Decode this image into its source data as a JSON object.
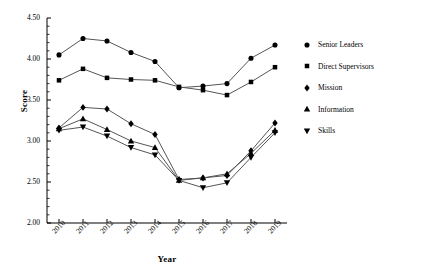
{
  "chart_data": {
    "type": "line",
    "title": "",
    "xlabel": "Year",
    "ylabel": "Score",
    "categories": [
      "2010",
      "2011",
      "2012",
      "2013",
      "2014",
      "2015",
      "2016",
      "2017",
      "2018",
      "2019"
    ],
    "ylim": [
      2.0,
      4.5
    ],
    "ytick_labels": [
      "2.00",
      "2.50",
      "3.00",
      "3.50",
      "4.00",
      "4.50"
    ],
    "ytick_values": [
      2.0,
      2.5,
      3.0,
      3.5,
      4.0,
      4.5
    ],
    "ytick_step": 0.5,
    "minor_ticks_per_interval": 5,
    "grid": false,
    "legend_position": "right",
    "series": [
      {
        "name": "Senior Leaders",
        "marker": "circle",
        "values": [
          4.05,
          4.25,
          4.22,
          4.08,
          3.97,
          3.65,
          3.67,
          3.7,
          4.01,
          4.17
        ]
      },
      {
        "name": "Direct Supervisors",
        "marker": "square",
        "values": [
          3.74,
          3.88,
          3.77,
          3.75,
          3.74,
          3.66,
          3.62,
          3.56,
          3.72,
          3.9
        ]
      },
      {
        "name": "Mission",
        "marker": "diamond",
        "values": [
          3.16,
          3.41,
          3.39,
          3.21,
          3.08,
          2.53,
          2.55,
          2.58,
          2.88,
          3.22
        ]
      },
      {
        "name": "Information",
        "marker": "triangle-up",
        "values": [
          3.15,
          3.27,
          3.14,
          3.0,
          2.92,
          2.52,
          2.55,
          2.6,
          2.85,
          3.13
        ]
      },
      {
        "name": "Skills",
        "marker": "triangle-down",
        "values": [
          3.13,
          3.17,
          3.06,
          2.92,
          2.83,
          2.52,
          2.43,
          2.49,
          2.8,
          3.1
        ]
      }
    ]
  },
  "colors": {
    "ink": "#000000",
    "line": "#555555",
    "axis": "#000000"
  }
}
